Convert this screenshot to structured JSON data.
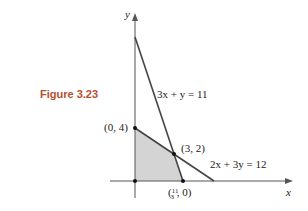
{
  "figure": {
    "caption": "Figure 3.23",
    "x_axis_label": "x",
    "y_axis_label": "y",
    "lines": [
      {
        "equation": "3x + y = 11",
        "label": "3x + y = 11"
      },
      {
        "equation": "2x + 3y = 12",
        "label": "2x + 3y = 12"
      }
    ],
    "points": [
      {
        "label": "(0, 4)",
        "x": 0,
        "y": 4
      },
      {
        "label": "(3, 2)",
        "x": 3,
        "y": 2
      },
      {
        "label": "(11/3, 0)",
        "x": 3.667,
        "y": 0
      },
      {
        "label": "",
        "x": 0,
        "y": 0
      }
    ],
    "shaded_region": "feasible region bounded by (0,0), (0,4), (3,2), (11/3,0)",
    "colors": {
      "caption": "#b5502e",
      "shade": "#d4d4d4",
      "line": "#444444"
    }
  }
}
